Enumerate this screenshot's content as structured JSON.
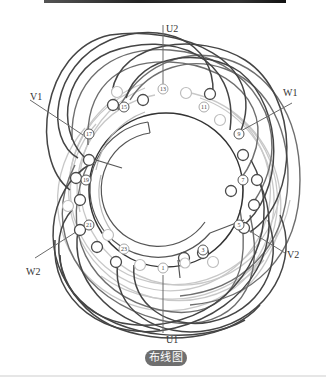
{
  "header": {
    "bar": "top-divider"
  },
  "diagram": {
    "type": "stator-winding-layout",
    "terminals": {
      "U1": "U1",
      "U2": "U2",
      "V1": "V1",
      "V2": "V2",
      "W1": "W1",
      "W2": "W2"
    },
    "slot_labels": {
      "s1": "1",
      "s3": "3",
      "s5": "5",
      "s7": "7",
      "s9": "9",
      "s11": "11",
      "s13": "13",
      "s15": "15",
      "s17": "17",
      "s19": "19",
      "s21": "21",
      "s23": "23"
    },
    "colors": {
      "dark_coil": "#4a4a4a",
      "mid_coil": "#6a6a6a",
      "light_coil": "#c4c4c4",
      "ring": "#333333"
    }
  },
  "caption": {
    "label": "布线图"
  }
}
